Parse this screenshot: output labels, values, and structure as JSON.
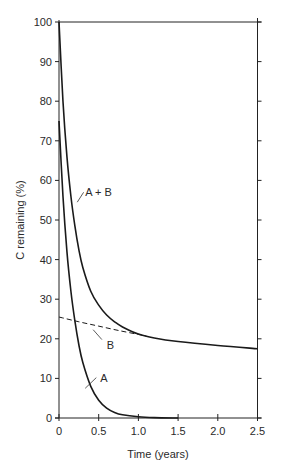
{
  "chart_data": {
    "type": "line",
    "title": "",
    "xlabel": "Time (years)",
    "ylabel": "C remaining (%)",
    "xlim": [
      0,
      2.5
    ],
    "ylim": [
      0,
      100
    ],
    "xticks": [
      0,
      0.5,
      1.0,
      1.5,
      2.0,
      2.5
    ],
    "xtick_labels": [
      "0",
      "0.5",
      "1.0",
      "1.5",
      "2.0",
      "2.5"
    ],
    "yticks": [
      0,
      10,
      20,
      30,
      40,
      50,
      60,
      70,
      80,
      90,
      100
    ],
    "ytick_labels": [
      "0",
      "10",
      "20",
      "30",
      "40",
      "50",
      "60",
      "70",
      "80",
      "90",
      "100"
    ],
    "grid": false,
    "legend": "none (inline annotations)",
    "series": [
      {
        "name": "A + B",
        "style": "solid",
        "x": [
          0,
          0.05,
          0.1,
          0.15,
          0.2,
          0.25,
          0.3,
          0.4,
          0.5,
          0.6,
          0.7,
          0.8,
          1.0,
          1.2,
          1.5,
          2.0,
          2.5
        ],
        "y": [
          100,
          80,
          66,
          56,
          48.5,
          42.5,
          38,
          32,
          28.5,
          26,
          24.3,
          23,
          21.2,
          20.2,
          19.3,
          18.3,
          17.5
        ]
      },
      {
        "name": "A",
        "style": "solid",
        "x": [
          0,
          0.05,
          0.1,
          0.15,
          0.2,
          0.25,
          0.3,
          0.4,
          0.5,
          0.6,
          0.7,
          0.8,
          1.0,
          1.2,
          1.5
        ],
        "y": [
          75,
          56,
          42,
          32,
          24.5,
          18.5,
          14,
          8,
          4.5,
          2.5,
          1.4,
          0.8,
          0.3,
          0.1,
          0
        ]
      },
      {
        "name": "B",
        "style": "dashed",
        "x": [
          0,
          0.25,
          0.5,
          0.75,
          1.0,
          1.1
        ],
        "y": [
          25.5,
          24.3,
          23.2,
          22.1,
          21.1,
          20.7
        ]
      }
    ],
    "annotations": [
      {
        "text": "A + B",
        "x": 0.33,
        "y": 57
      },
      {
        "text": "B",
        "x": 0.6,
        "y": 18.5
      },
      {
        "text": "A",
        "x": 0.52,
        "y": 10
      }
    ]
  }
}
